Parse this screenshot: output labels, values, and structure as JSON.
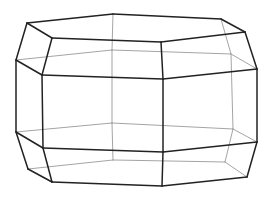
{
  "figure": {
    "width": 268,
    "height": 199,
    "colors": {
      "background": "#ffffff",
      "front_edge": "#222222",
      "back_edge": "#9a9a9a"
    },
    "vertices": {
      "t1": [
        27,
        23
      ],
      "t2": [
        113,
        14
      ],
      "t3": [
        221,
        19
      ],
      "t4": [
        245,
        32
      ],
      "t5": [
        161,
        42
      ],
      "t6": [
        52,
        38
      ],
      "m1": [
        16,
        60
      ],
      "m2": [
        112,
        50
      ],
      "m3": [
        231,
        54
      ],
      "m4": [
        257,
        69
      ],
      "m5": [
        163,
        79
      ],
      "m6": [
        42,
        75
      ],
      "n1": [
        16,
        132
      ],
      "n2": [
        112,
        123
      ],
      "n3": [
        233,
        129
      ],
      "n4": [
        257,
        142
      ],
      "n5": [
        163,
        152
      ],
      "n6": [
        43,
        148
      ],
      "b1": [
        28,
        169
      ],
      "b2": [
        113,
        160
      ],
      "b3": [
        225,
        162
      ],
      "b4": [
        247,
        177
      ],
      "b5": [
        162,
        186
      ],
      "b6": [
        52,
        182
      ]
    },
    "front_edges": [
      [
        "t1",
        "t2"
      ],
      [
        "t2",
        "t3"
      ],
      [
        "t3",
        "t4"
      ],
      [
        "t4",
        "t5"
      ],
      [
        "t5",
        "t6"
      ],
      [
        "t6",
        "t1"
      ],
      [
        "t1",
        "m1"
      ],
      [
        "t6",
        "m6"
      ],
      [
        "t5",
        "m5"
      ],
      [
        "t4",
        "m4"
      ],
      [
        "m1",
        "m6"
      ],
      [
        "m6",
        "m5"
      ],
      [
        "m5",
        "m4"
      ],
      [
        "m1",
        "n1"
      ],
      [
        "m6",
        "n6"
      ],
      [
        "m5",
        "n5"
      ],
      [
        "m4",
        "n4"
      ],
      [
        "n1",
        "n6"
      ],
      [
        "n6",
        "n5"
      ],
      [
        "n5",
        "n4"
      ],
      [
        "n1",
        "b1"
      ],
      [
        "n6",
        "b6"
      ],
      [
        "n5",
        "b5"
      ],
      [
        "n4",
        "b4"
      ],
      [
        "b1",
        "b6"
      ],
      [
        "b6",
        "b5"
      ],
      [
        "b5",
        "b4"
      ]
    ],
    "back_edges": [
      [
        "t2",
        "m2"
      ],
      [
        "t3",
        "m3"
      ],
      [
        "m1",
        "m2"
      ],
      [
        "m2",
        "m3"
      ],
      [
        "m3",
        "m4"
      ],
      [
        "m2",
        "n2"
      ],
      [
        "m3",
        "n3"
      ],
      [
        "n1",
        "n2"
      ],
      [
        "n2",
        "n3"
      ],
      [
        "n3",
        "n4"
      ],
      [
        "n2",
        "b2"
      ],
      [
        "n3",
        "b3"
      ],
      [
        "b1",
        "b2"
      ],
      [
        "b2",
        "b3"
      ],
      [
        "b3",
        "b4"
      ]
    ]
  }
}
